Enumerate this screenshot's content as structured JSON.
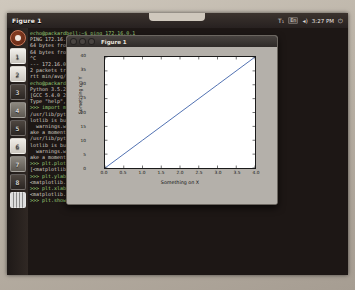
{
  "panel": {
    "window_title": "Figure 1",
    "indicators": [
      "keyboard-layout-icon",
      "network-icon",
      "volume-icon"
    ],
    "keyboard_label": "T₁",
    "network_label": "En",
    "volume_label": "◂)",
    "clock": "3:27 PM",
    "session_label": "⏻"
  },
  "launcher": {
    "items": [
      {
        "name": "dash-home",
        "label": ""
      },
      {
        "name": "app-1",
        "label": "1"
      },
      {
        "name": "app-2",
        "label": "2"
      },
      {
        "name": "app-3",
        "label": "3"
      },
      {
        "name": "app-4",
        "label": "4"
      },
      {
        "name": "app-5",
        "label": "5"
      },
      {
        "name": "app-6",
        "label": "6"
      },
      {
        "name": "app-7",
        "label": "7"
      },
      {
        "name": "app-8",
        "label": "8"
      },
      {
        "name": "workspace-switcher",
        "label": ""
      }
    ]
  },
  "figure_window": {
    "title": "Figure 1",
    "close_label": "",
    "minimize_label": "",
    "maximize_label": ""
  },
  "terminal": {
    "lines": [
      "echo@packardbell:~$ ping 172.16.0.1",
      "PING 172.16.0.1 (172.16.0.1) 56(84) bytes of data.",
      "64 bytes from 172.16.0.1: icmp_seq=1 ttl=64 time=2.51 ms",
      "64 bytes from 172.16.0.1: icmp_seq=2 ttl=64 time=1.98 ms",
      "^C",
      "--- 172.16.0.1 ping statistics ---",
      "2 packets transmitted, 2 received, 0% packet loss, time 1001ms",
      "rtt min/avg/max/mdev = 1.982/2.246/2.511/0.267 ms",
      "echo@packardbell:~$ python3",
      "Python 3.5.2 (default, Nov 17 2016, 17:05:23)",
      "[GCC 5.4.0 20160609] on linux",
      "Type \"help\", \"copyright\", \"credits\" or \"license\" for more information.",
      ">>> import matplotlib.pyplot as plt",
      "/usr/lib/python3/dist-packages/matplotlib/font_manager.py:273: UserWarning: matp",
      "lotlib is building the font cache using fc-list. This may take a moment.",
      "  warnings.warn('matplotlib is building the font cache using fc-list.'",
      "ake a moment.')",
      "/usr/lib/python3/dist-packages/matplotlib/font_manager.py:273: UserWarning: matp",
      "lotlib is building the font cache using fc-list. This may take a moment.",
      "  warnings.warn('matplotlib is building the font cache using fc-list. This may t",
      "ake a moment.')",
      ">>> plt.plot([0,1,2,3,4], [0,10,20,30,40])",
      "[<matplotlib.lines.Line2D object at 0x7fd8ba0de198>]",
      ">>> plt.ylabel('Something on Y')",
      "<matplotlib.text.Text object at 0x7fd8ba19b048>",
      ">>> plt.xlabel('Something on X')",
      "<matplotlib.text.Text object at 0x7fc6b9c3194b>",
      ">>> plt.show()"
    ]
  },
  "chart_data": {
    "type": "line",
    "title": "",
    "xlabel": "Something on X",
    "ylabel": "Something on Y",
    "x": [
      0,
      1,
      2,
      3,
      4
    ],
    "values": [
      0,
      10,
      20,
      30,
      40
    ],
    "series": [
      {
        "name": "line",
        "values": [
          0,
          10,
          20,
          30,
          40
        ]
      }
    ],
    "xlim": [
      0.0,
      4.0
    ],
    "ylim": [
      0,
      40
    ],
    "xticks": [
      "0.0",
      "0.5",
      "1.0",
      "1.5",
      "2.0",
      "2.5",
      "3.0",
      "3.5",
      "4.0"
    ],
    "yticks": [
      "0",
      "5",
      "10",
      "15",
      "20",
      "25",
      "30",
      "35",
      "40"
    ],
    "grid": false,
    "legend": "none",
    "line_color": "#3b5fa8"
  }
}
